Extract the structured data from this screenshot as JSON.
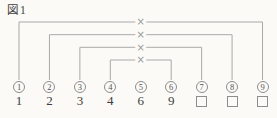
{
  "figure": {
    "label": "図1"
  },
  "diagram": {
    "cross_mark": "×",
    "columns": [
      {
        "id": "1",
        "number": "1",
        "value": "1",
        "answer_box": false
      },
      {
        "id": "2",
        "number": "2",
        "value": "2",
        "answer_box": false
      },
      {
        "id": "3",
        "number": "3",
        "value": "3",
        "answer_box": false
      },
      {
        "id": "4",
        "number": "4",
        "value": "4",
        "answer_box": false
      },
      {
        "id": "5",
        "number": "5",
        "value": "6",
        "answer_box": false
      },
      {
        "id": "6",
        "number": "6",
        "value": "9",
        "answer_box": false
      },
      {
        "id": "7",
        "number": "7",
        "value": "",
        "answer_box": true
      },
      {
        "id": "8",
        "number": "8",
        "value": "",
        "answer_box": true
      },
      {
        "id": "9",
        "number": "9",
        "value": "",
        "answer_box": true
      }
    ],
    "pairs": [
      {
        "from": 1,
        "to": 9,
        "mark": "×"
      },
      {
        "from": 2,
        "to": 8,
        "mark": "×"
      },
      {
        "from": 3,
        "to": 7,
        "mark": "×"
      },
      {
        "from": 4,
        "to": 6,
        "mark": "×"
      }
    ]
  }
}
